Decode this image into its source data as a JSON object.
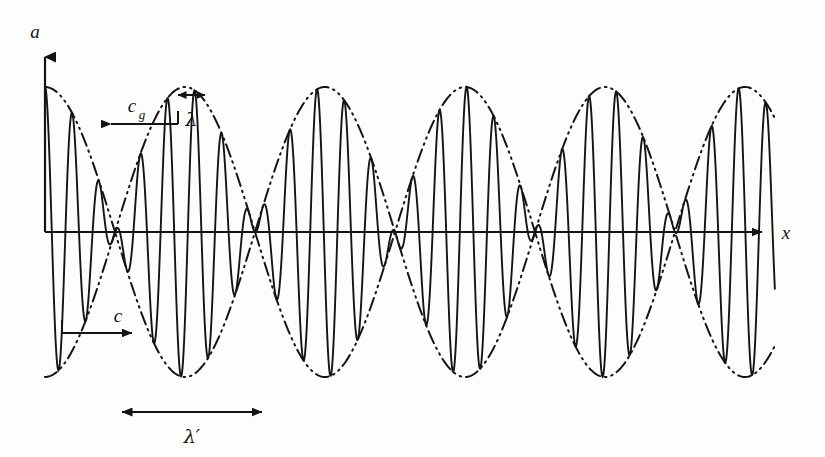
{
  "figure": {
    "background_color": "#fdfdfc",
    "ink_color": "#141414",
    "width": 825,
    "height": 457
  },
  "axes": {
    "y_label": "a",
    "x_label": "x",
    "origin_x": 45,
    "baseline_y": 232,
    "y_axis_top": 45,
    "x_axis_right": 775
  },
  "annotations": {
    "carrier_wavelength_label": "λ",
    "group_wavelength_label": "λ′",
    "phase_velocity_label": "c",
    "group_velocity_label_base": "c",
    "group_velocity_label_sub": "g",
    "phase_velocity_direction": "right",
    "group_velocity_direction": "left",
    "carrier_arrow": {
      "x1": 178,
      "x2": 205,
      "y": 95
    },
    "group_arrow": {
      "x1": 122,
      "x2": 262,
      "y": 412
    },
    "c_arrow": {
      "x1": 62,
      "x2": 135,
      "y": 333
    },
    "cg_arrow": {
      "x1": 108,
      "x2": 178,
      "y": 124
    }
  },
  "chart_data": {
    "type": "line",
    "xlabel": "x",
    "ylabel": "a",
    "grid": false,
    "legend": "none",
    "x_range_px": [
      45,
      775
    ],
    "baseline_y_px": 232,
    "envelope_amplitude_px": 145,
    "carrier_wavelength_px": 27.2,
    "group_wavelength_px": 140,
    "node_positions_px": [
      135,
      278,
      425,
      565,
      705
    ],
    "antinode_positions_px": [
      45,
      205,
      350,
      495,
      638,
      775
    ],
    "series": [
      {
        "name": "resultant wave",
        "style": "solid",
        "formula": "a = A cos(2*pi*x/lambda) * cos(pi*x/lambda_prime)"
      },
      {
        "name": "upper envelope",
        "style": "dash-dot-dot",
        "formula": "a = +A |cos(pi*x/lambda_prime)|"
      },
      {
        "name": "lower envelope",
        "style": "dash-dot-dot",
        "formula": "a = -A |cos(pi*x/lambda_prime)|"
      }
    ],
    "values": {
      "amplitude": 145,
      "carrier_wavelength": 27.2,
      "group_wavelength": 140,
      "number_of_beats_shown": 5
    }
  }
}
